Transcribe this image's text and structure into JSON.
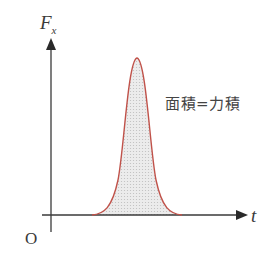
{
  "diagram": {
    "y_axis_label": "F",
    "y_axis_subscript": "x",
    "x_axis_label": "t",
    "origin_label": "O",
    "annotation": "面積=力積",
    "colors": {
      "axis": "#3a3a3a",
      "curve": "#c0524a",
      "fill": "#e6e6e6",
      "text": "#3a3a3a"
    },
    "curve": {
      "shape": "bell",
      "start_x": 92,
      "peak_x": 137,
      "peak_y": 58,
      "end_x": 182,
      "baseline_y": 215
    }
  }
}
